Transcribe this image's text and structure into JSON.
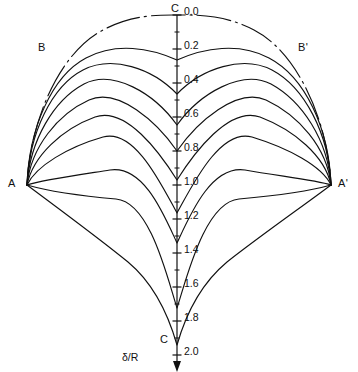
{
  "figure": {
    "kind": "contour-diagram",
    "background_color": "#ffffff",
    "line_color": "#111111",
    "width": 358,
    "height": 372
  },
  "axis": {
    "name": "delta-over-R axis",
    "title": "δ/R",
    "title_x": 122,
    "title_y": 351,
    "orientation": "vertical",
    "x": 177,
    "y_top": 15,
    "y_bottom": 355,
    "value_top": 0.0,
    "value_bottom": 2.0,
    "arrow_at": "bottom",
    "tick_labels": [
      "0.0",
      "0.2",
      "0.4",
      "0.6",
      "0.8",
      "1.0",
      "1.2",
      "1.4",
      "1.6",
      "1.8",
      "2.0"
    ],
    "tick_values": [
      0.0,
      0.2,
      0.4,
      0.6,
      0.8,
      1.0,
      1.2,
      1.4,
      1.6,
      1.8,
      2.0
    ],
    "minor_tick_values": [
      0.1,
      0.3,
      0.5,
      0.7,
      0.9,
      1.1,
      1.3,
      1.5,
      1.7,
      1.9
    ],
    "major_tick_len": 9,
    "minor_tick_len": 5,
    "label_dx": 7,
    "label_dy": 4
  },
  "vertices": [
    {
      "id": "C-top",
      "label": "C",
      "x": 177,
      "y": 15,
      "label_x": 171,
      "label_y": 2,
      "anchor": "above"
    },
    {
      "id": "C-bottom",
      "label": "C",
      "x": 177,
      "y": 345,
      "label_x": 160,
      "label_y": 333,
      "anchor": "left"
    },
    {
      "id": "A",
      "label": "A",
      "x": 27,
      "y": 185,
      "label_x": 8,
      "label_y": 177,
      "anchor": "left"
    },
    {
      "id": "A-prime",
      "label": "A'",
      "x": 331,
      "y": 185,
      "label_x": 338,
      "label_y": 177,
      "anchor": "right"
    },
    {
      "id": "B",
      "label": "B",
      "x": 58,
      "y": 62,
      "label_x": 38,
      "label_y": 41,
      "anchor": "left"
    },
    {
      "id": "B-prime",
      "label": "B'",
      "x": 293,
      "y": 62,
      "label_x": 298,
      "label_y": 41,
      "anchor": "right"
    }
  ],
  "chart_data": {
    "type": "line",
    "title": "",
    "xlabel": "",
    "ylabel": "δ/R",
    "ylim": [
      0.0,
      2.0
    ],
    "grid": false,
    "legend": "none",
    "series": [
      {
        "name": "contour-0",
        "style": "dashed",
        "cusp_value": 0.0,
        "path": "M 27 185 C 30 120, 60 52, 103 30 C 133 14, 160 15, 177 15 C 194 15, 224 14, 254 30 C 297 52, 328 120, 331 185"
      },
      {
        "name": "contour-1",
        "style": "solid",
        "cusp_value": 0.27,
        "path": "M 27 185 C 29 128, 52 76, 86 58 C 116 42, 150 48, 177 60 C 204 48, 239 42, 269 58 C 305 77, 329 128, 331 185"
      },
      {
        "name": "contour-2",
        "style": "solid",
        "cusp_value": 0.47,
        "path": "M 27 185 C 29 133, 52 86, 83 70 C 112 55, 152 68, 177 94 C 202 68, 243 55, 272 70 C 304 87, 329 133, 331 185"
      },
      {
        "name": "contour-3",
        "style": "solid",
        "cusp_value": 0.65,
        "path": "M 27 185 C 30 140, 54 100, 84 84 C 113 69, 154 93, 177 125 C 200 93, 242 69, 271 84 C 302 101, 328 140, 331 185"
      },
      {
        "name": "contour-4",
        "style": "solid",
        "cusp_value": 0.8,
        "path": "M 27 185 C 31 147, 58 114, 89 100 C 118 87, 157 122, 177 151 C 197 122, 237 87, 266 100 C 298 115, 327 147, 331 185"
      },
      {
        "name": "contour-5",
        "style": "solid",
        "cusp_value": 0.97,
        "path": "M 27 185 C 33 156, 62 129, 95 117 C 126 106, 160 153, 177 180 C 194 153, 229 106, 260 117 C 294 130, 325 156, 331 185"
      },
      {
        "name": "contour-6",
        "style": "solid",
        "cusp_value": 1.16,
        "path": "M 27 185 C 36 166, 68 147, 103 137 C 135 128, 162 186, 177 213 C 192 186, 220 128, 252 137 C 288 148, 322 166, 331 185"
      },
      {
        "name": "contour-7",
        "style": "solid",
        "cusp_value": 1.36,
        "path": "M 27 185 C 42 180, 78 175, 110 170 C 144 165, 164 215, 177 243 C 190 215, 211 165, 245 170 C 278 176, 316 180, 331 185"
      },
      {
        "name": "contour-8",
        "style": "solid",
        "cusp_value": 1.72,
        "path": "M 27 185 C 48 191, 82 196, 116 199 C 150 202, 167 277, 177 308 C 187 277, 205 202, 239 199 C 273 196, 310 191, 331 185"
      },
      {
        "name": "contour-9",
        "style": "solid",
        "cusp_value": 2.0,
        "path": "M 27 185 C 55 206, 96 236, 128 262 C 158 287, 171 324, 177 345 C 183 324, 197 287, 227 262 C 260 236, 303 206, 331 185"
      }
    ]
  }
}
